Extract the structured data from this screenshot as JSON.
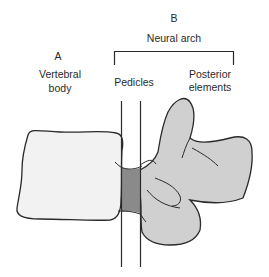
{
  "labels": {
    "b_letter": "B",
    "neural_arch": "Neural arch",
    "a_letter": "A",
    "vertebral_body_line1": "Vertebral",
    "vertebral_body_line2": "body",
    "pedicles": "Pedicles",
    "posterior_line1": "Posterior",
    "posterior_line2": "elements"
  },
  "colors": {
    "background": "#ffffff",
    "outline": "#2a2a2a",
    "vertebral_body_fill": "#f2f2f2",
    "posterior_fill": "#d0d0d0",
    "pedicle_fill": "#8a8a8a"
  }
}
